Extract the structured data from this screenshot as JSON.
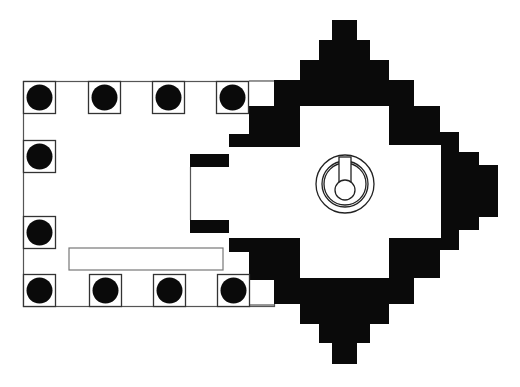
{
  "diagram": {
    "type": "architectural-floor-plan",
    "colors": {
      "wall": "#0a0a0a",
      "line": "#555555",
      "background": "#ffffff"
    },
    "hall": {
      "x": 23,
      "y": 81,
      "w": 251,
      "h": 225
    },
    "columns": [
      {
        "x": 23,
        "y": 81
      },
      {
        "x": 88,
        "y": 81
      },
      {
        "x": 152,
        "y": 81
      },
      {
        "x": 216,
        "y": 81
      },
      {
        "x": 23,
        "y": 140
      },
      {
        "x": 23,
        "y": 216
      },
      {
        "x": 23,
        "y": 274
      },
      {
        "x": 89,
        "y": 274
      },
      {
        "x": 153,
        "y": 274
      },
      {
        "x": 217,
        "y": 274
      }
    ],
    "column_size": 32,
    "bench": {
      "x": 69,
      "y": 248,
      "w": 154,
      "h": 22
    },
    "linga": {
      "cx": 345,
      "cy": 184,
      "r_outer": 29,
      "r_mid": 23,
      "r_inner": 21,
      "r_core": 10,
      "spout": {
        "x": 339,
        "y": 157,
        "w": 12,
        "h": 26
      }
    }
  }
}
